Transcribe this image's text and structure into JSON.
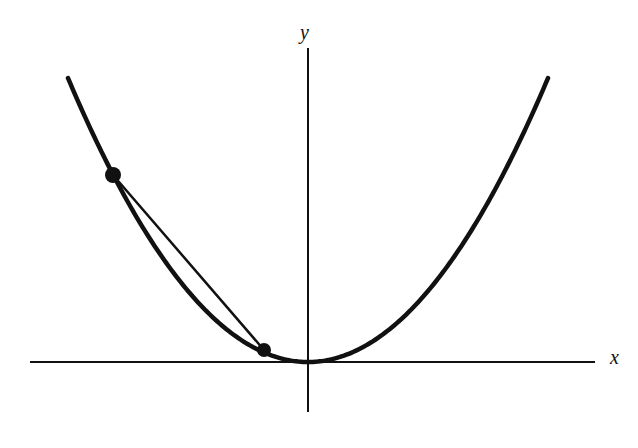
{
  "figure": {
    "kind": "math-diagram",
    "title_visible": false,
    "background_color": "#ffffff",
    "ink_color": "#111111",
    "labels": {
      "y_axis": "y",
      "x_axis": "x"
    }
  },
  "chart_data": {
    "type": "line",
    "title": "",
    "xlabel": "x",
    "ylabel": "y",
    "grid": false,
    "legend": false,
    "axes": {
      "x_axis_pixel_y": 362,
      "y_axis_pixel_x": 308,
      "x_axis_pixel_span": [
        30,
        595
      ],
      "y_axis_pixel_span": [
        48,
        412
      ],
      "origin_pixel": [
        308,
        362
      ],
      "x_axis_arrowhead": false,
      "y_axis_arrowhead": false,
      "tick_marks": false,
      "tick_labels": []
    },
    "series": [
      {
        "name": "parabola",
        "role": "curve",
        "equation": "y = a*(x - h)^2",
        "vertex_pixel": [
          308,
          362
        ],
        "pixel_coefficient_a": 0.00493,
        "stroke_width_px": 4.5,
        "color": "#111111",
        "pixel_points": [
          [
            68,
            78
          ],
          [
            92,
            128
          ],
          [
            116,
            172
          ],
          [
            140,
            212
          ],
          [
            164,
            246
          ],
          [
            188,
            276
          ],
          [
            212,
            301
          ],
          [
            236,
            322
          ],
          [
            260,
            339
          ],
          [
            284,
            354
          ],
          [
            308,
            362
          ],
          [
            332,
            359
          ],
          [
            356,
            348
          ],
          [
            380,
            332
          ],
          [
            404,
            310
          ],
          [
            428,
            283
          ],
          [
            452,
            251
          ],
          [
            476,
            214
          ],
          [
            500,
            172
          ],
          [
            524,
            126
          ],
          [
            548,
            77
          ]
        ]
      },
      {
        "name": "secant-chord",
        "role": "chord",
        "stroke_width_px": 2.5,
        "color": "#111111",
        "from_pixel": [
          113,
          175
        ],
        "to_pixel": [
          264,
          350
        ]
      }
    ],
    "markers": [
      {
        "name": "upper-point",
        "pixel": [
          113,
          175
        ],
        "radius_px": 8,
        "filled": true,
        "color": "#111111"
      },
      {
        "name": "lower-point",
        "pixel": [
          264,
          350
        ],
        "radius_px": 7,
        "filled": true,
        "color": "#111111"
      }
    ],
    "annotations": []
  }
}
